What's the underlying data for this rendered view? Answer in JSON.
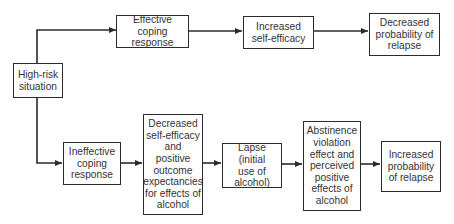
{
  "diagram": {
    "type": "flowchart",
    "title": "",
    "nodes": [
      {
        "id": "high_risk",
        "label": "High-risk situation"
      },
      {
        "id": "effective_coping",
        "label": "Effective coping response"
      },
      {
        "id": "increased_self_efficacy",
        "label": "Increased self-efficacy"
      },
      {
        "id": "decreased_prob_relapse",
        "label": "Decreased probability of relapse"
      },
      {
        "id": "ineffective_coping",
        "label": "Ineffective coping response"
      },
      {
        "id": "decreased_self_efficacy",
        "label": "Decreased self-efficacy and positive outcome expectancies for effects of alcohol"
      },
      {
        "id": "lapse",
        "label": "Lapse (initial use of alcohol)"
      },
      {
        "id": "abstinence_violation",
        "label": "Abstinence violation effect and perceived positive effects of alcohol"
      },
      {
        "id": "increased_prob_relapse",
        "label": "Increased probability of relapse"
      }
    ],
    "edges": [
      {
        "from": "high_risk",
        "to": "effective_coping"
      },
      {
        "from": "effective_coping",
        "to": "increased_self_efficacy"
      },
      {
        "from": "increased_self_efficacy",
        "to": "decreased_prob_relapse"
      },
      {
        "from": "high_risk",
        "to": "ineffective_coping"
      },
      {
        "from": "ineffective_coping",
        "to": "decreased_self_efficacy"
      },
      {
        "from": "decreased_self_efficacy",
        "to": "lapse"
      },
      {
        "from": "lapse",
        "to": "abstinence_violation"
      },
      {
        "from": "abstinence_violation",
        "to": "increased_prob_relapse"
      }
    ]
  },
  "labels": {
    "high_risk": [
      "High-risk",
      "situation"
    ],
    "effective_coping": [
      "Effective coping",
      "response"
    ],
    "increased_self_efficacy": [
      "Increased",
      "self-efficacy"
    ],
    "decreased_prob_relapse": [
      "Decreased",
      "probability of",
      "relapse"
    ],
    "ineffective_coping": [
      "Ineffective",
      "coping",
      "response"
    ],
    "decreased_self_efficacy": [
      "Decreased",
      "self-efficacy",
      "and",
      "positive",
      "outcome",
      "expectancies",
      "for effects of",
      "alcohol"
    ],
    "lapse": [
      "Lapse (initial",
      "use of",
      "alcohol)"
    ],
    "abstinence_violation": [
      "Abstinence",
      "violation",
      "effect and",
      "perceived",
      "positive",
      "effects of",
      "alcohol"
    ],
    "increased_prob_relapse": [
      "Increased",
      "probability",
      "of relapse"
    ]
  },
  "colors": {
    "line": "#2b2b2b",
    "text": "#333333",
    "background": "#ffffff"
  }
}
